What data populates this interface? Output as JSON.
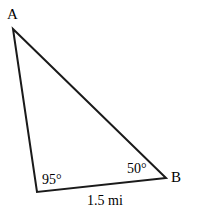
{
  "figure": {
    "type": "triangle-diagram",
    "stroke_color": "#1a1a1a",
    "background_color": "#ffffff",
    "stroke_width": 2
  },
  "vertices": {
    "a": {
      "label": "A",
      "x": 13,
      "y": 29
    },
    "b": {
      "label": "B",
      "x": 166,
      "y": 178
    },
    "c": {
      "label": "",
      "x": 37,
      "y": 192
    }
  },
  "angles": {
    "at_c": {
      "label": "95°",
      "value": 95,
      "unit": "degrees"
    },
    "at_b": {
      "label": "50°",
      "value": 50,
      "unit": "degrees"
    }
  },
  "sides": {
    "cb": {
      "label": "1.5 mi",
      "value": 1.5,
      "unit": "mi"
    }
  }
}
